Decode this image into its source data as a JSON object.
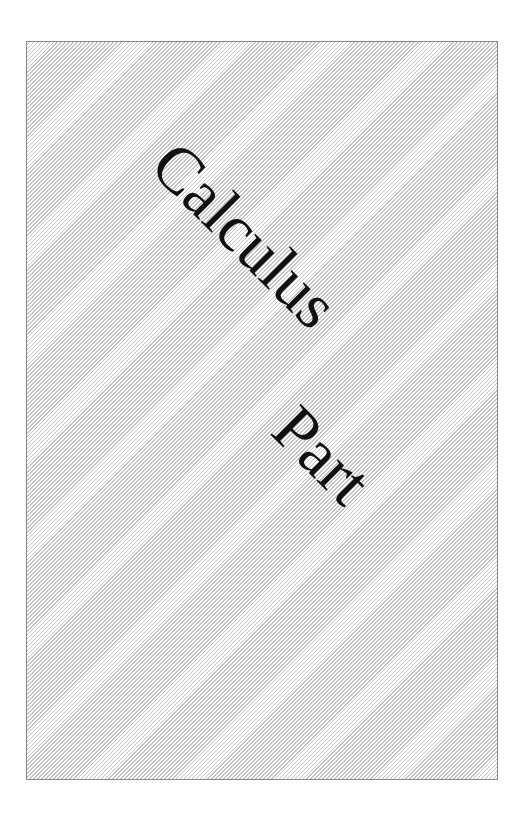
{
  "cover": {
    "title": "Calculus",
    "subtitle": "Part",
    "colors": {
      "background": "#ffffff",
      "hatch": "#c4c4c4",
      "border": "#8a8a8a",
      "text": "#111111"
    }
  }
}
